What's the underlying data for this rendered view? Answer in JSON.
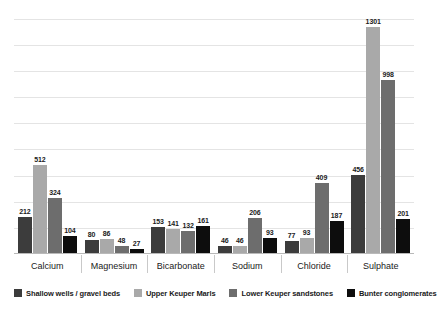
{
  "chart_data": {
    "type": "bar",
    "title": "",
    "subtitle": "",
    "xlabel": "",
    "ylabel": "",
    "ylim": [
      0,
      1400
    ],
    "grid": true,
    "gridline_values": [
      0,
      150,
      300,
      450,
      600,
      750,
      900,
      1050,
      1200,
      1350
    ],
    "legend_position": "bottom",
    "categories": [
      "Calcium",
      "Magnesium",
      "Bicarbonate",
      "Sodium",
      "Chloride",
      "Sulphate"
    ],
    "series": [
      {
        "name": "Shallow wells / gravel beds",
        "color": "#3c3c3c",
        "values": [
          212,
          80,
          153,
          46,
          77,
          456
        ]
      },
      {
        "name": "Upper Keuper Marls",
        "color": "#a9a9a9",
        "values": [
          512,
          86,
          141,
          46,
          93,
          1301
        ]
      },
      {
        "name": "Lower Keuper sandstones",
        "color": "#6d6d6d",
        "values": [
          324,
          48,
          132,
          206,
          409,
          998
        ]
      },
      {
        "name": "Bunter conglomerates",
        "color": "#0d0d0d",
        "values": [
          104,
          27,
          161,
          93,
          187,
          201
        ]
      }
    ]
  },
  "colors": {
    "background": "#ffffff",
    "gridline": "#e4e4e4",
    "axis": "#b9b9b9",
    "separator": "#c9c9c9",
    "text": "#1a1a1a"
  }
}
